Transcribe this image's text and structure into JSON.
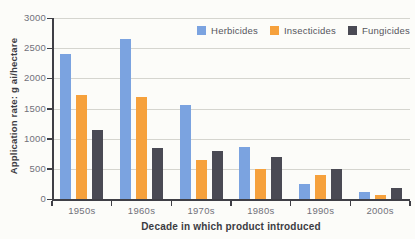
{
  "chart_data": {
    "type": "bar",
    "title": "",
    "xlabel": "Decade in which product introduced",
    "ylabel": "Application rate: g ai/hectare",
    "categories": [
      "1950s",
      "1960s",
      "1970s",
      "1980s",
      "1990s",
      "2000s"
    ],
    "series": [
      {
        "name": "Herbicides",
        "color": "#7ba3e0",
        "values": [
          2400,
          2650,
          1550,
          860,
          250,
          120
        ]
      },
      {
        "name": "Insecticides",
        "color": "#f6a13c",
        "values": [
          1720,
          1690,
          650,
          500,
          390,
          70
        ]
      },
      {
        "name": "Fungicides",
        "color": "#4a4a54",
        "values": [
          1150,
          840,
          790,
          690,
          500,
          190
        ]
      }
    ],
    "ylim": [
      0,
      3000
    ],
    "ytick_step": 500,
    "yticks": [
      "0",
      "500",
      "1000",
      "1500",
      "2000",
      "2500",
      "3000"
    ],
    "grid": true,
    "legend_position": "top-right"
  },
  "colors": {
    "background": "#fcfcf9",
    "gridline": "#d5d5cf",
    "axis": "#3f3f46",
    "tick_text": "#71717a",
    "title_text": "#3b3b42",
    "legend_text": "#55555c"
  }
}
